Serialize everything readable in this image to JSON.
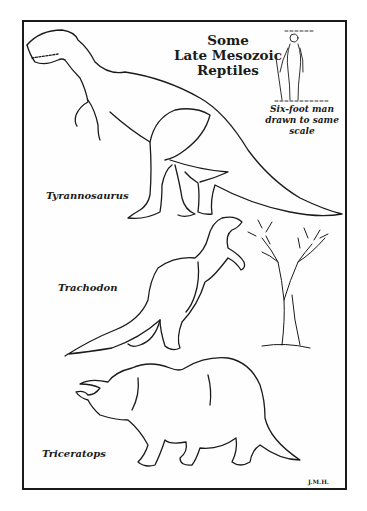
{
  "illustration": {
    "title_lines": [
      "Some",
      "Late Mesozoic",
      "Reptiles"
    ],
    "scale_caption_lines": [
      "Six-foot man",
      "drawn to same",
      "scale"
    ],
    "labels": {
      "tyrannosaurus": "Tyrannosaurus",
      "trachodon": "Trachodon",
      "triceratops": "Triceratops"
    },
    "signature": "J.M.H.",
    "colors": {
      "ink": "#1a1a1a",
      "paper": "#ffffff"
    }
  }
}
